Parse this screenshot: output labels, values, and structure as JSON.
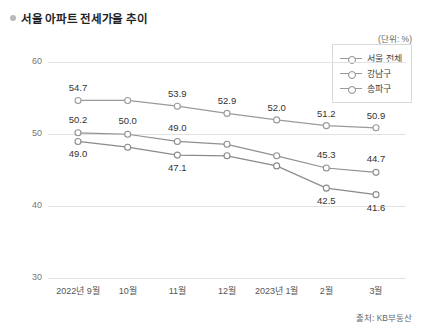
{
  "header": {
    "title": "서울 아파트 전세가율 추이",
    "bullet_icon": "bullet-dot-icon"
  },
  "unit_note": "(단위: %)",
  "source_note": "출처: KB부동산",
  "legend": {
    "items": [
      {
        "label": "서울 전체",
        "marker": "open-circle-marker"
      },
      {
        "label": "강남구",
        "marker": "open-circle-marker"
      },
      {
        "label": "송파구",
        "marker": "open-circle-marker"
      }
    ]
  },
  "chart_data": {
    "type": "line",
    "title": "서울 아파트 전세가율 추이",
    "xlabel": "",
    "ylabel": "",
    "unit": "%",
    "ylim": [
      30,
      62
    ],
    "yticks": [
      30,
      40,
      50,
      60
    ],
    "grid": true,
    "legend_position": "top-right",
    "categories": [
      "2022년 9월",
      "10월",
      "11월",
      "12월",
      "2023년 1월",
      "2월",
      "3월"
    ],
    "series": [
      {
        "name": "서울 전체",
        "color": "#9a9a9a",
        "values": [
          54.7,
          54.7,
          53.9,
          52.9,
          52.0,
          51.2,
          50.9
        ],
        "labels": [
          "54.7",
          "",
          "53.9",
          "52.9",
          "52.0",
          "51.2",
          "50.9"
        ]
      },
      {
        "name": "강남구",
        "color": "#8f8f8f",
        "values": [
          50.2,
          50.0,
          49.0,
          48.6,
          47.0,
          45.3,
          44.7
        ],
        "labels": [
          "50.2",
          "50.0",
          "49.0",
          "",
          "",
          "45.3",
          "44.7"
        ]
      },
      {
        "name": "송파구",
        "color": "#8a8a8a",
        "values": [
          49.0,
          48.2,
          47.1,
          47.0,
          45.6,
          42.5,
          41.6
        ],
        "labels": [
          "49.0",
          "",
          "47.1",
          "",
          "",
          "42.5",
          "41.6"
        ]
      }
    ]
  }
}
